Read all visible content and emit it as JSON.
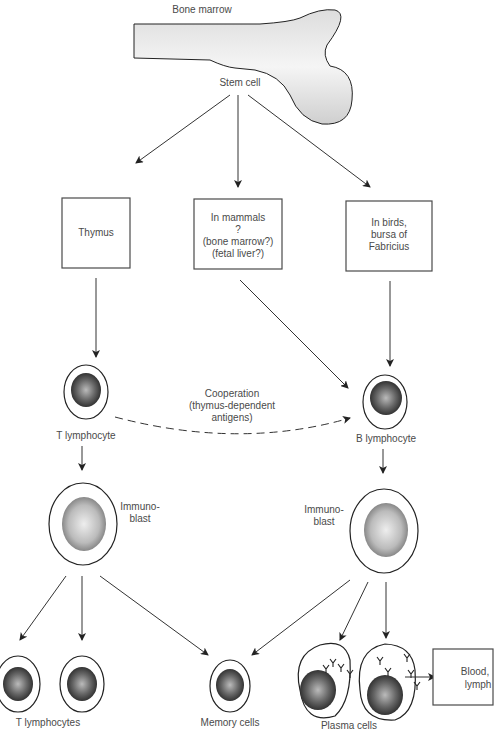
{
  "labels": {
    "bone_marrow": "Bone marrow",
    "stem_cell": "Stem cell",
    "thymus": "Thymus",
    "mammals": [
      "In mammals",
      "?",
      "(bone marrow?)",
      "(fetal liver?)"
    ],
    "birds": [
      "In birds,",
      "bursa of",
      "Fabricius"
    ],
    "cooperation": [
      "Cooperation",
      "(thymus-dependent",
      "antigens)"
    ],
    "t_lymphocyte": "T lymphocyte",
    "b_lymphocyte": "B lymphocyte",
    "immunoblast_left": [
      "Immuno-",
      "blast"
    ],
    "immunoblast_right": [
      "Immuno-",
      "blast"
    ],
    "t_lymphocytes": "T lymphocytes",
    "memory_cells": "Memory cells",
    "plasma_cells": "Plasma cells",
    "blood_lymph": [
      "Blood,",
      "lymph"
    ]
  },
  "colors": {
    "ink": "#333333",
    "text": "#4a4a4a",
    "nucleus": "#555555",
    "background": "#ffffff"
  }
}
